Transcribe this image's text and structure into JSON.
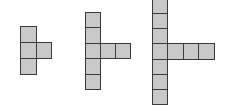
{
  "diagram": {
    "colors": {
      "fill": "#c9c9c9",
      "stroke": "#3a3a3a",
      "background": "#ffffff"
    },
    "figures": [
      {
        "name": "figure-1",
        "vertical_squares": 3,
        "arm_squares": 1,
        "total_squares": 4
      },
      {
        "name": "figure-2",
        "vertical_squares": 5,
        "arm_squares": 2,
        "total_squares": 7
      },
      {
        "name": "figure-3",
        "vertical_squares": 7,
        "arm_squares": 3,
        "total_squares": 10
      }
    ]
  }
}
